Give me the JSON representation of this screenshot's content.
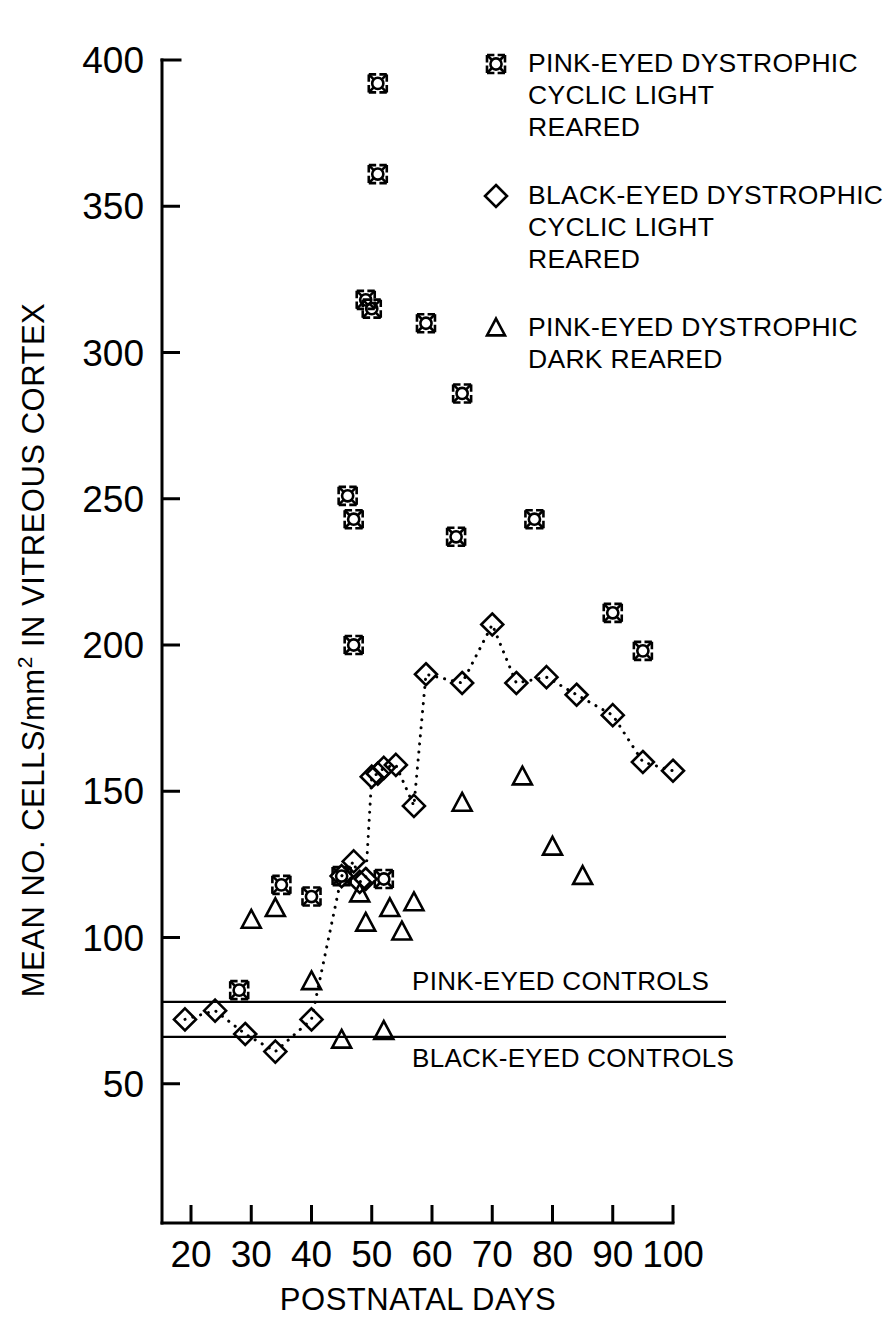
{
  "chart_data": {
    "type": "scatter",
    "title": "",
    "xlabel": "POSTNATAL DAYS",
    "ylabel": "MEAN NO. CELLS/mm2 IN VITREOUS CORTEX",
    "ylabel_main": "MEAN NO. CELLS/mm",
    "ylabel_sup": "2",
    "ylabel_tail": " IN VITREOUS CORTEX",
    "xlim": [
      15,
      103
    ],
    "ylim": [
      28,
      405
    ],
    "grid": false,
    "legend_position": "top-right",
    "xticks": [
      20,
      30,
      40,
      50,
      60,
      70,
      80,
      90,
      100
    ],
    "yticks": [
      50,
      100,
      150,
      200,
      250,
      300,
      350,
      400
    ],
    "xtick_labels": [
      "20",
      "30",
      "40",
      "50",
      "60",
      "70",
      "80",
      "90",
      "100"
    ],
    "ytick_labels": [
      "50",
      "100",
      "150",
      "200",
      "250",
      "300",
      "350",
      "400"
    ],
    "series": [
      {
        "name": "PINK-EYED DYSTROPHIC CYCLIC LIGHT REARED",
        "marker": "star-square",
        "connected": false,
        "points": [
          [
            28,
            82
          ],
          [
            35,
            118
          ],
          [
            40,
            114
          ],
          [
            45,
            121
          ],
          [
            46,
            251
          ],
          [
            47,
            243
          ],
          [
            47,
            200
          ],
          [
            49,
            318
          ],
          [
            50,
            315
          ],
          [
            51,
            392
          ],
          [
            51,
            361
          ],
          [
            52,
            120
          ],
          [
            59,
            310
          ],
          [
            64,
            237
          ],
          [
            65,
            286
          ],
          [
            77,
            243
          ],
          [
            90,
            211
          ],
          [
            95,
            198
          ]
        ]
      },
      {
        "name": "BLACK-EYED DYSTROPHIC CYCLIC LIGHT REARED",
        "marker": "diamond",
        "connected": true,
        "points": [
          [
            19,
            72
          ],
          [
            24,
            75
          ],
          [
            29,
            67
          ],
          [
            34,
            61
          ],
          [
            40,
            72
          ],
          [
            45,
            121
          ],
          [
            47,
            126
          ],
          [
            48,
            119
          ],
          [
            49,
            120
          ],
          [
            50,
            155
          ],
          [
            51,
            156
          ],
          [
            52,
            158
          ],
          [
            54,
            159
          ],
          [
            57,
            145
          ],
          [
            59,
            190
          ],
          [
            65,
            187
          ],
          [
            70,
            207
          ],
          [
            74,
            187
          ],
          [
            79,
            189
          ],
          [
            84,
            183
          ],
          [
            90,
            176
          ],
          [
            95,
            160
          ],
          [
            100,
            157
          ]
        ]
      },
      {
        "name": "PINK-EYED DYSTROPHIC DARK REARED",
        "marker": "triangle",
        "connected": false,
        "points": [
          [
            30,
            106
          ],
          [
            34,
            110
          ],
          [
            40,
            85
          ],
          [
            45,
            65
          ],
          [
            48,
            115
          ],
          [
            49,
            105
          ],
          [
            52,
            68
          ],
          [
            53,
            110
          ],
          [
            55,
            102
          ],
          [
            57,
            112
          ],
          [
            65,
            146
          ],
          [
            75,
            155
          ],
          [
            80,
            131
          ],
          [
            85,
            121
          ]
        ]
      }
    ],
    "reference_lines": [
      {
        "label": "PINK-EYED CONTROLS",
        "value": 78,
        "label_position": "above"
      },
      {
        "label": "BLACK-EYED CONTROLS",
        "value": 66,
        "label_position": "below"
      }
    ],
    "legend": [
      {
        "marker": "star-square",
        "lines": [
          "PINK-EYED DYSTROPHIC",
          "CYCLIC LIGHT",
          "REARED"
        ]
      },
      {
        "marker": "diamond",
        "lines": [
          "BLACK-EYED DYSTROPHIC",
          "CYCLIC LIGHT",
          "REARED"
        ]
      },
      {
        "marker": "triangle",
        "lines": [
          "PINK-EYED DYSTROPHIC",
          "DARK REARED"
        ]
      }
    ],
    "colors": {
      "ink": "#000000",
      "background": "#ffffff"
    }
  }
}
